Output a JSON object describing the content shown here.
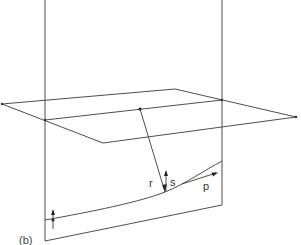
{
  "diagram": {
    "caption": "(b)",
    "labels": {
      "r": "r",
      "s": "s",
      "p": "p"
    },
    "colors": {
      "line": "#3a3a3a",
      "background": "#ffffff"
    }
  }
}
